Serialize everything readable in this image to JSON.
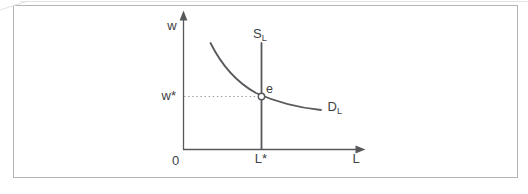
{
  "figure": {
    "axes": {
      "y_label": "w",
      "x_label": "L",
      "origin_label": "0"
    },
    "curves": {
      "supply": {
        "label_main": "S",
        "label_sub": "L"
      },
      "demand": {
        "label_main": "D",
        "label_sub": "L"
      }
    },
    "equilibrium": {
      "point_label": "e",
      "wage_label": "w*",
      "labor_label": "L*"
    },
    "colors": {
      "line": "#58595d",
      "text": "#404145",
      "dotted_line": "#a0a0a0",
      "box_border": "#b5b5b5",
      "background": "#ffffff"
    }
  }
}
